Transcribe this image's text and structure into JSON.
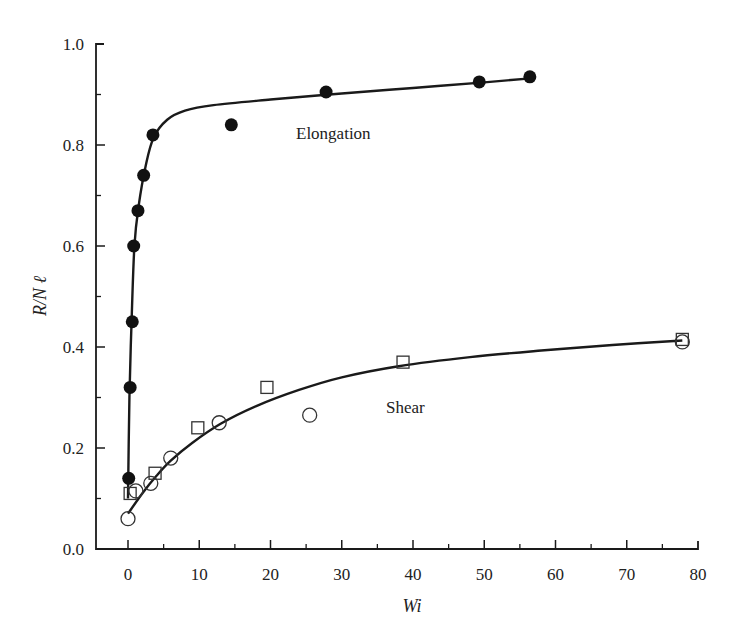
{
  "chart_data": {
    "type": "scatter",
    "title": "",
    "xlabel": "Wi",
    "ylabel": "R/N ℓ",
    "xlim": [
      -4.5,
      80
    ],
    "ylim": [
      0.0,
      1.0
    ],
    "xticks": [
      0,
      10,
      20,
      30,
      40,
      50,
      60,
      70,
      80
    ],
    "xtick_labels": [
      "0",
      "10",
      "20",
      "30",
      "40",
      "50",
      "60",
      "70",
      "80"
    ],
    "yticks": [
      0.0,
      0.2,
      0.4,
      0.6,
      0.8,
      1.0
    ],
    "ytick_labels": [
      "0.0",
      "0.2",
      "0.4",
      "0.6",
      "0.8",
      "1.0"
    ],
    "grid": false,
    "legend": null,
    "annotations": [
      {
        "text": "Elongation",
        "x": 24,
        "y": 0.82
      },
      {
        "text": "Shear",
        "x": 36.5,
        "y": 0.27
      }
    ],
    "series": [
      {
        "name": "Elongation",
        "marker": "filled-circle",
        "points": [
          {
            "x": 0.1,
            "y": 0.14
          },
          {
            "x": 0.3,
            "y": 0.32
          },
          {
            "x": 0.6,
            "y": 0.45
          },
          {
            "x": 0.8,
            "y": 0.6
          },
          {
            "x": 1.4,
            "y": 0.67
          },
          {
            "x": 2.2,
            "y": 0.74
          },
          {
            "x": 3.5,
            "y": 0.82
          },
          {
            "x": 14.5,
            "y": 0.84
          },
          {
            "x": 27.8,
            "y": 0.905
          },
          {
            "x": 49.3,
            "y": 0.925
          },
          {
            "x": 56.4,
            "y": 0.935
          }
        ],
        "fit_curve": [
          {
            "x": 0.0,
            "y": 0.1
          },
          {
            "x": 0.2,
            "y": 0.3
          },
          {
            "x": 0.5,
            "y": 0.45
          },
          {
            "x": 0.9,
            "y": 0.6
          },
          {
            "x": 1.5,
            "y": 0.68
          },
          {
            "x": 2.5,
            "y": 0.76
          },
          {
            "x": 3.6,
            "y": 0.815
          },
          {
            "x": 5.5,
            "y": 0.85
          },
          {
            "x": 8,
            "y": 0.868
          },
          {
            "x": 12,
            "y": 0.879
          },
          {
            "x": 20,
            "y": 0.89
          },
          {
            "x": 30,
            "y": 0.902
          },
          {
            "x": 40,
            "y": 0.913
          },
          {
            "x": 50,
            "y": 0.924
          },
          {
            "x": 56.5,
            "y": 0.932
          }
        ]
      },
      {
        "name": "Shear (circles)",
        "marker": "open-circle",
        "points": [
          {
            "x": 0.0,
            "y": 0.06
          },
          {
            "x": 1.1,
            "y": 0.115
          },
          {
            "x": 3.2,
            "y": 0.13
          },
          {
            "x": 6.0,
            "y": 0.18
          },
          {
            "x": 12.8,
            "y": 0.25
          },
          {
            "x": 25.5,
            "y": 0.265
          },
          {
            "x": 77.8,
            "y": 0.41
          }
        ]
      },
      {
        "name": "Shear (squares)",
        "marker": "open-square",
        "points": [
          {
            "x": 0.3,
            "y": 0.11
          },
          {
            "x": 3.8,
            "y": 0.15
          },
          {
            "x": 9.8,
            "y": 0.24
          },
          {
            "x": 19.5,
            "y": 0.32
          },
          {
            "x": 38.6,
            "y": 0.37
          },
          {
            "x": 77.8,
            "y": 0.415
          }
        ],
        "fit_curve": [
          {
            "x": 0.0,
            "y": 0.07
          },
          {
            "x": 2,
            "y": 0.11
          },
          {
            "x": 4,
            "y": 0.145
          },
          {
            "x": 6,
            "y": 0.175
          },
          {
            "x": 9,
            "y": 0.21
          },
          {
            "x": 13,
            "y": 0.248
          },
          {
            "x": 18,
            "y": 0.283
          },
          {
            "x": 24,
            "y": 0.315
          },
          {
            "x": 30,
            "y": 0.34
          },
          {
            "x": 38,
            "y": 0.362
          },
          {
            "x": 48,
            "y": 0.38
          },
          {
            "x": 58,
            "y": 0.393
          },
          {
            "x": 68,
            "y": 0.404
          },
          {
            "x": 77.8,
            "y": 0.413
          }
        ]
      }
    ],
    "plot_area_px": {
      "x0": 128,
      "x_per_unit": 7.125,
      "y0": 549,
      "y_per_unit": 505,
      "axis_left": 96,
      "axis_right": 698
    }
  }
}
